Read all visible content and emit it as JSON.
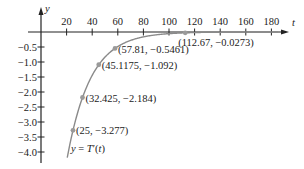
{
  "chart_data": {
    "type": "line",
    "title": "",
    "xlabel": "t",
    "ylabel": "y",
    "xlim": [
      0,
      185
    ],
    "ylim": [
      -4.3,
      0.8
    ],
    "x_ticks": [
      20,
      40,
      60,
      80,
      100,
      120,
      140,
      160,
      180
    ],
    "x_tick_labels": [
      "20",
      "40",
      "60",
      "80",
      "100",
      "120",
      "140",
      "160",
      "180"
    ],
    "y_ticks": [
      -0.5,
      -1.0,
      -1.5,
      -2.0,
      -2.5,
      -3.0,
      -3.5,
      -4.0
    ],
    "y_tick_labels": [
      "−0.5",
      "−1.0",
      "−1.5",
      "−2.0",
      "−2.5",
      "−3.0",
      "−3.5",
      "−4.0"
    ],
    "grid": false,
    "series": [
      {
        "name": "y = T′(t)",
        "color": "#8a8a8a",
        "points": [
          {
            "x": 25,
            "y": -3.277,
            "label": "(25, −3.277)"
          },
          {
            "x": 32.425,
            "y": -2.184,
            "label": "(32.425, −2.184)"
          },
          {
            "x": 45.1175,
            "y": -1.092,
            "label": "(45.1175, −1.092)"
          },
          {
            "x": 57.81,
            "y": -0.5461,
            "label": "(57.81, −0.5461)"
          },
          {
            "x": 112.67,
            "y": -0.0273,
            "label": "(112.67, −0.0273)"
          }
        ]
      }
    ],
    "annotations": [
      {
        "text": "y = T′(t)",
        "near": [
          25,
          -3.6
        ]
      }
    ]
  },
  "labels": {
    "x_axis": "t",
    "y_axis": "y",
    "curve": "y = T′(t)"
  },
  "colors": {
    "axis": "#222222",
    "curve": "#8a8a8a",
    "point": "#9a9a9a"
  }
}
